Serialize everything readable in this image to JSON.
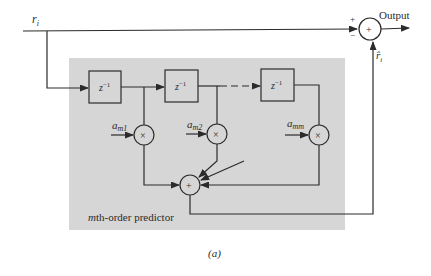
{
  "diagram": {
    "caption": "(a)",
    "colors": {
      "background": "#ffffff",
      "predictor_region": "#d6d6d6",
      "lines": "#2b2b2b"
    },
    "input": {
      "label": "r",
      "subscript": "i"
    },
    "output": {
      "label": "Output",
      "summer_symbol": "+",
      "plus_sign": "+",
      "minus_sign": "−"
    },
    "feedback": {
      "label": "r̂",
      "subscript": "i"
    },
    "predictor": {
      "label_italic": "m",
      "label_rest": "th-order predictor",
      "delays": [
        {
          "label": "z",
          "exponent": "−1"
        },
        {
          "label": "z",
          "exponent": "−1"
        },
        {
          "label": "z",
          "exponent": "−1"
        }
      ],
      "coefficients": [
        {
          "label": "a",
          "subscript": "m1"
        },
        {
          "label": "a",
          "subscript": "m2"
        },
        {
          "label": "a",
          "subscript": "mm"
        }
      ],
      "multiplier_symbol": "×",
      "summer_symbol": "+"
    }
  }
}
